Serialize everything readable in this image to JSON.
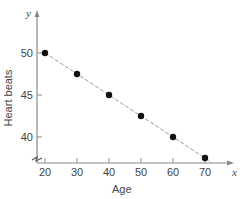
{
  "chart_data": {
    "type": "scatter",
    "title": "",
    "xlabel": "Age",
    "ylabel": "Heart beats",
    "x_axis_var": "x",
    "y_axis_var": "y",
    "x": [
      20,
      30,
      40,
      50,
      60,
      70
    ],
    "y": [
      50,
      47.5,
      45,
      42.5,
      40,
      37.5
    ],
    "x_ticks": [
      20,
      30,
      40,
      50,
      60,
      70
    ],
    "y_ticks": [
      40,
      45,
      50
    ],
    "xlim": [
      17,
      76
    ],
    "ylim": [
      36.9,
      52.5
    ],
    "trend_line": {
      "style": "dashed",
      "slope": -0.25,
      "intercept": 55
    },
    "axis_break": "y",
    "grid": false,
    "legend": null
  },
  "colors": {
    "axis": "#8a8a8a",
    "points": "#111111",
    "trend_line": "#9a9a9a",
    "text": "#444444"
  }
}
